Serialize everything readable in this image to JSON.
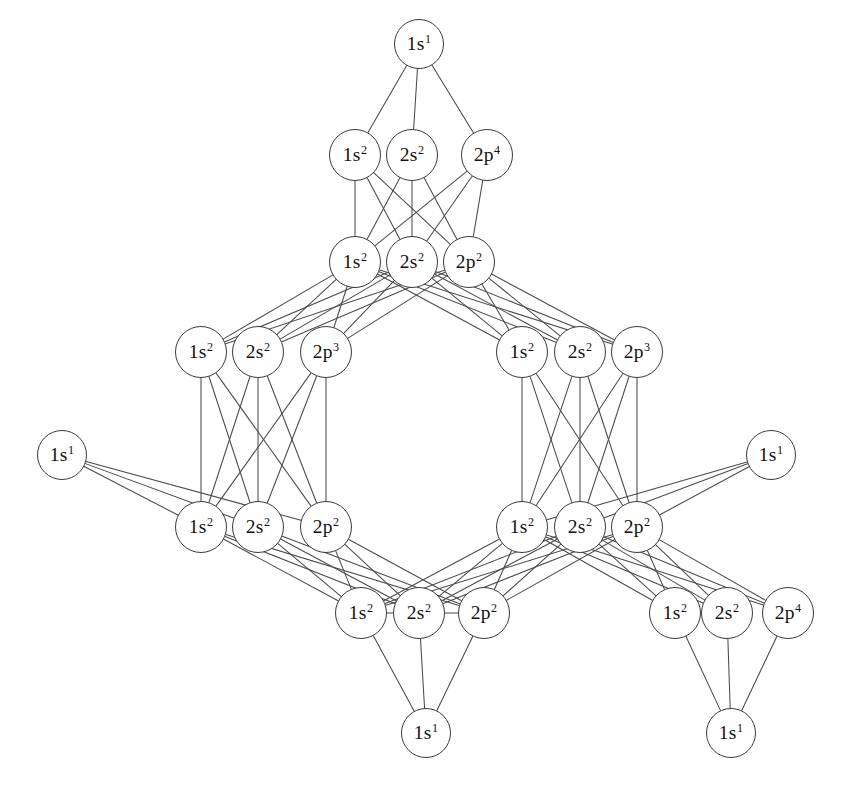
{
  "diagram": {
    "type": "node-link-graph",
    "node_shape": "circle",
    "edge_color": "#4a4a4a",
    "node_border_color": "#3a3a3a",
    "background_color": "#ffffff",
    "node_count": 30,
    "group_count": 8,
    "hydrogen_count": 6
  },
  "groups": [
    {
      "id": "g-top",
      "name": "top-oxygen-group",
      "cx": 412,
      "cy": 262,
      "nodes": [
        {
          "id": "n-top-1",
          "shell": "1s",
          "electrons": "2",
          "label": "1s2",
          "cx": 355,
          "cy": 262
        },
        {
          "id": "n-top-2",
          "shell": "2s",
          "electrons": "2",
          "label": "2s2",
          "cx": 412,
          "cy": 262
        },
        {
          "id": "n-top-3",
          "shell": "2p",
          "electrons": "2",
          "label": "2p2",
          "cx": 469,
          "cy": 262
        }
      ]
    },
    {
      "id": "g-upper",
      "name": "upper-oxygen-group",
      "cx": 412,
      "cy": 155,
      "nodes": [
        {
          "id": "n-up-1",
          "shell": "1s",
          "electrons": "2",
          "label": "1s2",
          "cx": 355,
          "cy": 155
        },
        {
          "id": "n-up-2",
          "shell": "2s",
          "electrons": "2",
          "label": "2s2",
          "cx": 412,
          "cy": 155
        },
        {
          "id": "n-up-3",
          "shell": "2p",
          "electrons": "4",
          "label": "2p4",
          "cx": 487,
          "cy": 155
        }
      ]
    },
    {
      "id": "g-left-upper",
      "name": "left-upper-nitrogen-group",
      "cx": 258,
      "cy": 352,
      "nodes": [
        {
          "id": "n-lu-1",
          "shell": "1s",
          "electrons": "2",
          "label": "1s2",
          "cx": 201,
          "cy": 352
        },
        {
          "id": "n-lu-2",
          "shell": "2s",
          "electrons": "2",
          "label": "2s2",
          "cx": 258,
          "cy": 352
        },
        {
          "id": "n-lu-3",
          "shell": "2p",
          "electrons": "3",
          "label": "2p3",
          "cx": 326,
          "cy": 352
        }
      ]
    },
    {
      "id": "g-right-upper",
      "name": "right-upper-nitrogen-group",
      "cx": 580,
      "cy": 352,
      "nodes": [
        {
          "id": "n-ru-1",
          "shell": "1s",
          "electrons": "2",
          "label": "1s2",
          "cx": 522,
          "cy": 352
        },
        {
          "id": "n-ru-2",
          "shell": "2s",
          "electrons": "2",
          "label": "2s2",
          "cx": 580,
          "cy": 352
        },
        {
          "id": "n-ru-3",
          "shell": "2p",
          "electrons": "3",
          "label": "2p3",
          "cx": 637,
          "cy": 352
        }
      ]
    },
    {
      "id": "g-left-lower",
      "name": "left-lower-carbon-group",
      "cx": 258,
      "cy": 527,
      "nodes": [
        {
          "id": "n-ll-1",
          "shell": "1s",
          "electrons": "2",
          "label": "1s2",
          "cx": 201,
          "cy": 527
        },
        {
          "id": "n-ll-2",
          "shell": "2s",
          "electrons": "2",
          "label": "2s2",
          "cx": 258,
          "cy": 527
        },
        {
          "id": "n-ll-3",
          "shell": "2p",
          "electrons": "2",
          "label": "2p2",
          "cx": 326,
          "cy": 527
        }
      ]
    },
    {
      "id": "g-right-lower",
      "name": "right-lower-carbon-group",
      "cx": 580,
      "cy": 527,
      "nodes": [
        {
          "id": "n-rl-1",
          "shell": "1s",
          "electrons": "2",
          "label": "1s2",
          "cx": 522,
          "cy": 527
        },
        {
          "id": "n-rl-2",
          "shell": "2s",
          "electrons": "2",
          "label": "2s2",
          "cx": 580,
          "cy": 527
        },
        {
          "id": "n-rl-3",
          "shell": "2p",
          "electrons": "2",
          "label": "2p2",
          "cx": 637,
          "cy": 527
        }
      ]
    },
    {
      "id": "g-bottom",
      "name": "bottom-center-carbon-group",
      "cx": 419,
      "cy": 613,
      "nodes": [
        {
          "id": "n-bc-1",
          "shell": "1s",
          "electrons": "2",
          "label": "1s2",
          "cx": 361,
          "cy": 613
        },
        {
          "id": "n-bc-2",
          "shell": "2s",
          "electrons": "2",
          "label": "2s2",
          "cx": 419,
          "cy": 613
        },
        {
          "id": "n-bc-3",
          "shell": "2p",
          "electrons": "2",
          "label": "2p2",
          "cx": 484,
          "cy": 613
        }
      ]
    },
    {
      "id": "g-bottom-right",
      "name": "bottom-right-oxygen-group",
      "cx": 727,
      "cy": 613,
      "nodes": [
        {
          "id": "n-br-1",
          "shell": "1s",
          "electrons": "2",
          "label": "1s2",
          "cx": 675,
          "cy": 613
        },
        {
          "id": "n-br-2",
          "shell": "2s",
          "electrons": "2",
          "label": "2s2",
          "cx": 727,
          "cy": 613
        },
        {
          "id": "n-br-3",
          "shell": "2p",
          "electrons": "4",
          "label": "2p4",
          "cx": 788,
          "cy": 613
        }
      ]
    }
  ],
  "hydrogens": [
    {
      "id": "h-apex",
      "name": "hydrogen-apex",
      "shell": "1s",
      "electrons": "1",
      "label": "1s1",
      "cx": 419,
      "cy": 44
    },
    {
      "id": "h-left",
      "name": "hydrogen-left",
      "shell": "1s",
      "electrons": "1",
      "label": "1s1",
      "cx": 62,
      "cy": 455
    },
    {
      "id": "h-right",
      "name": "hydrogen-right",
      "shell": "1s",
      "electrons": "1",
      "label": "1s1",
      "cx": 771,
      "cy": 455
    },
    {
      "id": "h-bottom-center",
      "name": "hydrogen-bottom-center",
      "shell": "1s",
      "electrons": "1",
      "label": "1s1",
      "cx": 426,
      "cy": 733
    },
    {
      "id": "h-bottom-right",
      "name": "hydrogen-bottom-right",
      "shell": "1s",
      "electrons": "1",
      "label": "1s1",
      "cx": 731,
      "cy": 733
    }
  ],
  "edges": {
    "group_to_group": [
      {
        "from": "g-upper",
        "to": "g-top",
        "style": "full-bipartite"
      },
      {
        "from": "g-top",
        "to": "g-left-upper",
        "style": "full-bipartite"
      },
      {
        "from": "g-top",
        "to": "g-right-upper",
        "style": "full-bipartite"
      },
      {
        "from": "g-left-upper",
        "to": "g-left-lower",
        "style": "full-bipartite"
      },
      {
        "from": "g-right-upper",
        "to": "g-right-lower",
        "style": "full-bipartite"
      },
      {
        "from": "g-left-lower",
        "to": "g-bottom",
        "style": "full-bipartite"
      },
      {
        "from": "g-right-lower",
        "to": "g-bottom",
        "style": "full-bipartite"
      },
      {
        "from": "g-right-lower",
        "to": "g-bottom-right",
        "style": "full-bipartite"
      }
    ],
    "hydrogen_to_group": [
      {
        "from": "h-apex",
        "to": "g-upper",
        "style": "fan"
      },
      {
        "from": "h-left",
        "to": "g-left-lower",
        "style": "fan"
      },
      {
        "from": "h-right",
        "to": "g-right-lower",
        "style": "fan"
      },
      {
        "from": "h-bottom-center",
        "to": "g-bottom",
        "style": "fan"
      },
      {
        "from": "h-bottom-right",
        "to": "g-bottom-right",
        "style": "fan"
      }
    ],
    "intra_group": [
      {
        "group": "g-bottom",
        "style": "chain"
      }
    ]
  }
}
